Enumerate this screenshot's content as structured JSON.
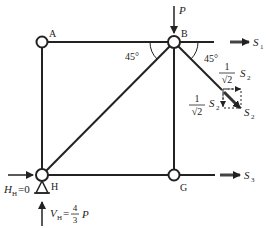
{
  "diagram": {
    "type": "truss free-body (method of sections)",
    "nodes": {
      "A": {
        "label": "A"
      },
      "B": {
        "label": "B"
      },
      "G": {
        "label": "G"
      },
      "H": {
        "label": "H"
      }
    },
    "angles": {
      "left": "45°",
      "right": "45°"
    },
    "loads": {
      "P": "P",
      "S1": "S",
      "S1_sub": "1",
      "S2": "S",
      "S2_sub": "2",
      "S3": "S",
      "S3_sub": "3"
    },
    "components": {
      "upper_coef_num": "1",
      "upper_coef_den": "√2",
      "upper_sym": "S",
      "upper_sub": "2",
      "lower_coef_num": "1",
      "lower_coef_den": "√2",
      "lower_sym": "S",
      "lower_sub": "2"
    },
    "reactions": {
      "HH_sym": "H",
      "HH_sub": "H",
      "HH_eq": "=0",
      "VH_sym": "V",
      "VH_sub": "H",
      "VH_eq": "=",
      "VH_num": "4",
      "VH_den": "3",
      "VH_P": "P"
    },
    "colors": {
      "line": "#222222",
      "arrow": "#333333",
      "background": "#ffffff"
    }
  }
}
